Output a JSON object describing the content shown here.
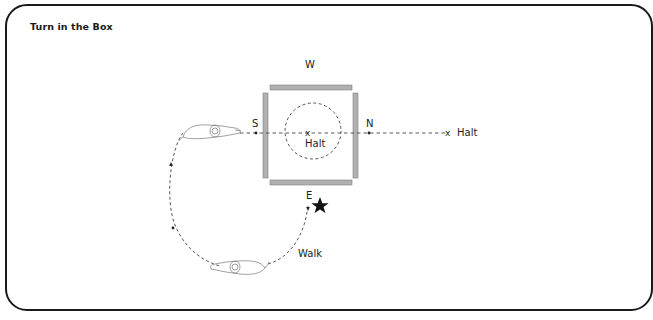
{
  "title": "Turn in the Box",
  "labels": {
    "west": "W",
    "south": "S",
    "north": "N",
    "east": "E",
    "center_halt": "Halt",
    "right_halt": "Halt",
    "walk": "Walk"
  },
  "markers": {
    "center_x": "x",
    "right_x": "x"
  },
  "colors": {
    "bar_fill": "#b0b0b0",
    "bar_stroke": "#808080",
    "line": "#444444",
    "frame": "#1a1a1a"
  }
}
